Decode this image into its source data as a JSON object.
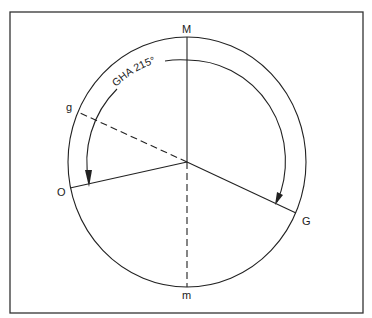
{
  "diagram": {
    "type": "celestial-hour-angle-diagram",
    "labels": {
      "top": "M",
      "bottom": "m",
      "left": "O",
      "upper_left": "g",
      "lower_right": "G"
    },
    "arc_label": "GHA 215°",
    "colors": {
      "stroke": "#222222",
      "background": "#ffffff",
      "frame": "#333333"
    },
    "elements": {
      "outer_circle": "celestial equator",
      "meridian_upper": "M (solid)",
      "meridian_lower": "m (dashed)",
      "radius_O": "solid",
      "radius_G": "solid",
      "radius_g": "dashed",
      "angle_arc": "GHA measured westward from M to G, arrows at O and G"
    }
  }
}
